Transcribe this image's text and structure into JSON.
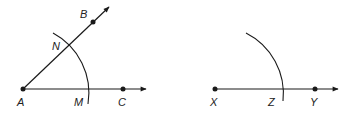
{
  "figure_left": {
    "points": {
      "A": {
        "label": "A",
        "x": 23,
        "y": 89
      },
      "B": {
        "label": "B",
        "x": 93,
        "y": 22
      },
      "C": {
        "label": "C",
        "x": 123,
        "y": 89
      },
      "N": {
        "label": "N",
        "x": 70,
        "y": 45
      },
      "M": {
        "label": "M",
        "x": 90,
        "y": 89
      }
    }
  },
  "figure_right": {
    "points": {
      "X": {
        "label": "X",
        "x": 215,
        "y": 89
      },
      "Y": {
        "label": "Y",
        "x": 315,
        "y": 89
      },
      "Z": {
        "label": "Z",
        "x": 282,
        "y": 89
      }
    }
  },
  "colors": {
    "stroke": "#1a1a1a",
    "label": "#222222"
  }
}
